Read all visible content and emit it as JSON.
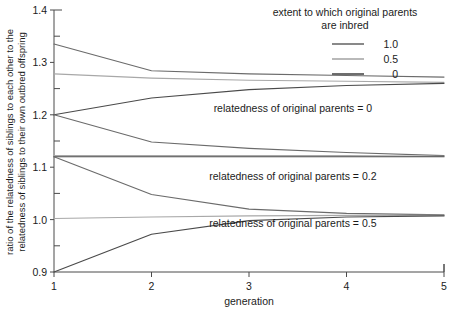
{
  "chart_data": {
    "type": "line",
    "title": "",
    "xlabel": "generation",
    "ylabel": "ratio of the relatedness of siblings to each other to the relatedness of siblings to their own outbred offspring",
    "ylabel_line1": "ratio of the relatedness of siblings to each other to the",
    "ylabel_line2": "relatedness of siblings to their own outbred offspring",
    "x": [
      1,
      2,
      3,
      4,
      5
    ],
    "xlim": [
      1,
      5
    ],
    "ylim": [
      0.9,
      1.4
    ],
    "xticks": [
      1,
      2,
      3,
      4,
      5
    ],
    "yticks": [
      "0.9",
      "1.0",
      "1.1",
      "1.2",
      "1.3",
      "1.4"
    ],
    "yticks_minor": [
      0.95,
      1.05,
      1.15,
      1.25,
      1.35
    ],
    "grid": false,
    "legend": {
      "title_line1": "extent to which original parents",
      "title_line2": "are inbred",
      "position": "top-right",
      "entries": [
        {
          "label": "1.0",
          "color": "#6b6b6b"
        },
        {
          "label": "0.5",
          "color": "#a8a8a8"
        },
        {
          "label": "0",
          "color": "#4a4a4a"
        }
      ]
    },
    "annotations": [
      {
        "text": "relatedness of original parents = 0",
        "x": 3.45,
        "y": 1.205
      },
      {
        "text": "relatedness of original parents = 0.2",
        "x": 3.45,
        "y": 1.075
      },
      {
        "text": "relatedness of original parents = 0.5",
        "x": 3.45,
        "y": 0.985
      }
    ],
    "groups": [
      {
        "name": "relatedness of original parents = 0",
        "series": [
          {
            "name": "inbreeding 1.0",
            "color": "#6b6b6b",
            "values": [
              1.335,
              1.284,
              1.278,
              1.275,
              1.272
            ]
          },
          {
            "name": "inbreeding 0.5",
            "color": "#a8a8a8",
            "values": [
              1.278,
              1.27,
              1.266,
              1.264,
              1.262
            ]
          },
          {
            "name": "inbreeding 0",
            "color": "#4a4a4a",
            "values": [
              1.2,
              1.232,
              1.248,
              1.256,
              1.26
            ]
          }
        ]
      },
      {
        "name": "relatedness of original parents = 0.2",
        "series": [
          {
            "name": "inbreeding 1.0",
            "color": "#6b6b6b",
            "values": [
              1.2,
              1.148,
              1.136,
              1.128,
              1.122
            ]
          },
          {
            "name": "inbreeding 0.5",
            "color": "#a8a8a8",
            "values": [
              1.122,
              1.122,
              1.122,
              1.122,
              1.121
            ]
          },
          {
            "name": "inbreeding 0",
            "color": "#4a4a4a",
            "values": [
              1.12,
              1.12,
              1.12,
              1.12,
              1.12
            ]
          }
        ]
      },
      {
        "name": "relatedness of original parents = 0.5",
        "series": [
          {
            "name": "inbreeding 1.0",
            "color": "#6b6b6b",
            "values": [
              1.12,
              1.048,
              1.02,
              1.012,
              1.009
            ]
          },
          {
            "name": "inbreeding 0.5",
            "color": "#a8a8a8",
            "values": [
              1.002,
              1.005,
              1.007,
              1.008,
              1.008
            ]
          },
          {
            "name": "inbreeding 0",
            "color": "#4a4a4a",
            "values": [
              0.9,
              0.972,
              0.998,
              1.005,
              1.007
            ]
          }
        ]
      }
    ]
  }
}
